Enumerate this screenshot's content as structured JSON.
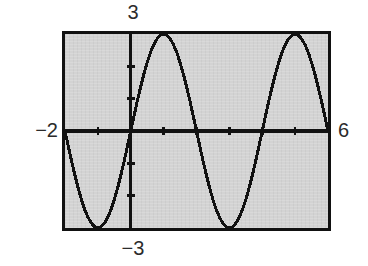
{
  "figure": {
    "kind": "graphing-calculator-screen",
    "background_color": "#ffffff",
    "screen_fill_color": "#d3d3d3",
    "ink_color": "#111111"
  },
  "labels": {
    "y_max": "3",
    "y_min": "−3",
    "x_min": "−2",
    "x_max": "6"
  },
  "chart_data": {
    "type": "line",
    "title": "",
    "xlabel": "",
    "ylabel": "",
    "xlim": [
      -2,
      6
    ],
    "ylim": [
      -3,
      3
    ],
    "grid": false,
    "legend": null,
    "tick_labels": {
      "x": [
        "−2",
        "6"
      ],
      "y": [
        "−3",
        "3"
      ]
    },
    "x_tick_step": 1,
    "y_tick_step": 1,
    "x_ticks": [
      -2,
      -1,
      0,
      1,
      2,
      3,
      4,
      5,
      6
    ],
    "y_ticks": [
      -3,
      -2,
      -1,
      0,
      1,
      2,
      3
    ],
    "series": [
      {
        "name": "y = 3 sin(πx / 2)",
        "amplitude": 3,
        "period": 4,
        "phase": 0,
        "points": [
          [
            -2.0,
            0.0
          ],
          [
            -1.9,
            -0.47
          ],
          [
            -1.8,
            -0.93
          ],
          [
            -1.7,
            -1.36
          ],
          [
            -1.6,
            -1.76
          ],
          [
            -1.5,
            -2.12
          ],
          [
            -1.4,
            -2.43
          ],
          [
            -1.3,
            -2.67
          ],
          [
            -1.2,
            -2.85
          ],
          [
            -1.1,
            -2.96
          ],
          [
            -1.0,
            -3.0
          ],
          [
            -0.9,
            -2.96
          ],
          [
            -0.8,
            -2.85
          ],
          [
            -0.7,
            -2.67
          ],
          [
            -0.6,
            -2.43
          ],
          [
            -0.5,
            -2.12
          ],
          [
            -0.4,
            -1.76
          ],
          [
            -0.3,
            -1.36
          ],
          [
            -0.2,
            -0.93
          ],
          [
            -0.1,
            -0.47
          ],
          [
            0.0,
            0.0
          ],
          [
            0.1,
            0.47
          ],
          [
            0.2,
            0.93
          ],
          [
            0.3,
            1.36
          ],
          [
            0.4,
            1.76
          ],
          [
            0.5,
            2.12
          ],
          [
            0.6,
            2.43
          ],
          [
            0.7,
            2.67
          ],
          [
            0.8,
            2.85
          ],
          [
            0.9,
            2.96
          ],
          [
            1.0,
            3.0
          ],
          [
            1.1,
            2.96
          ],
          [
            1.2,
            2.85
          ],
          [
            1.3,
            2.67
          ],
          [
            1.4,
            2.43
          ],
          [
            1.5,
            2.12
          ],
          [
            1.6,
            1.76
          ],
          [
            1.7,
            1.36
          ],
          [
            1.8,
            0.93
          ],
          [
            1.9,
            0.47
          ],
          [
            2.0,
            0.0
          ],
          [
            2.1,
            -0.47
          ],
          [
            2.2,
            -0.93
          ],
          [
            2.3,
            -1.36
          ],
          [
            2.4,
            -1.76
          ],
          [
            2.5,
            -2.12
          ],
          [
            2.6,
            -2.43
          ],
          [
            2.7,
            -2.67
          ],
          [
            2.8,
            -2.85
          ],
          [
            2.9,
            -2.96
          ],
          [
            3.0,
            -3.0
          ],
          [
            3.1,
            -2.96
          ],
          [
            3.2,
            -2.85
          ],
          [
            3.3,
            -2.67
          ],
          [
            3.4,
            -2.43
          ],
          [
            3.5,
            -2.12
          ],
          [
            3.6,
            -1.76
          ],
          [
            3.7,
            -1.36
          ],
          [
            3.8,
            -0.93
          ],
          [
            3.9,
            -0.47
          ],
          [
            4.0,
            0.0
          ],
          [
            4.1,
            0.47
          ],
          [
            4.2,
            0.93
          ],
          [
            4.3,
            1.36
          ],
          [
            4.4,
            1.76
          ],
          [
            4.5,
            2.12
          ],
          [
            4.6,
            2.43
          ],
          [
            4.7,
            2.67
          ],
          [
            4.8,
            2.85
          ],
          [
            4.9,
            2.96
          ],
          [
            5.0,
            3.0
          ],
          [
            5.1,
            2.96
          ],
          [
            5.2,
            2.85
          ],
          [
            5.3,
            2.67
          ],
          [
            5.4,
            2.43
          ],
          [
            5.5,
            2.12
          ],
          [
            5.6,
            1.76
          ],
          [
            5.7,
            1.36
          ],
          [
            5.8,
            0.93
          ],
          [
            5.9,
            0.47
          ],
          [
            6.0,
            0.0
          ]
        ]
      }
    ],
    "annotations": []
  }
}
